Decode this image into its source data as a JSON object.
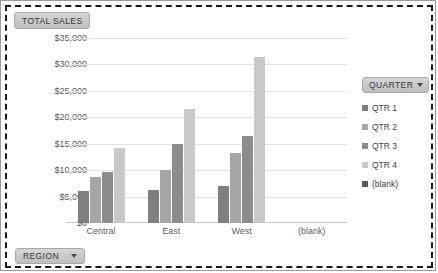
{
  "value_field": {
    "label": "TOTAL SALES"
  },
  "region_filter": {
    "label": "REGION",
    "icon": "chevron-down-icon"
  },
  "legend_header": {
    "label": "QUARTER",
    "icon": "chevron-down-icon"
  },
  "colors": {
    "qtr1": "#7f7f7f",
    "qtr2": "#a6a6a6",
    "qtr3": "#8c8c8c",
    "qtr4": "#c9c9c9",
    "blank": "#595959",
    "gridline": "#e2e2e2",
    "text": "#5e5e5e"
  },
  "chart_data": {
    "type": "bar",
    "title": "",
    "xlabel": "",
    "ylabel": "",
    "categories": [
      "Central",
      "East",
      "West",
      "(blank)"
    ],
    "ylim": [
      0,
      35000
    ],
    "ytick_labels": [
      "$35,000",
      "$30,000",
      "$25,000",
      "$20,000",
      "$15,000",
      "$10,000",
      "$5,000",
      "$0"
    ],
    "ytick_values": [
      35000,
      30000,
      25000,
      20000,
      15000,
      10000,
      5000,
      0
    ],
    "grid": true,
    "legend_position": "right",
    "series": [
      {
        "name": "QTR 1",
        "color": "#7f7f7f",
        "values": [
          6000,
          6200,
          7000,
          null
        ]
      },
      {
        "name": "QTR 2",
        "color": "#a6a6a6",
        "values": [
          8800,
          10000,
          13200,
          null
        ]
      },
      {
        "name": "QTR 3",
        "color": "#8c8c8c",
        "values": [
          9700,
          14900,
          16500,
          null
        ]
      },
      {
        "name": "QTR 4",
        "color": "#c9c9c9",
        "values": [
          14100,
          21600,
          31500,
          null
        ]
      },
      {
        "name": "(blank)",
        "color": "#595959",
        "values": [
          null,
          null,
          null,
          null
        ]
      }
    ]
  }
}
